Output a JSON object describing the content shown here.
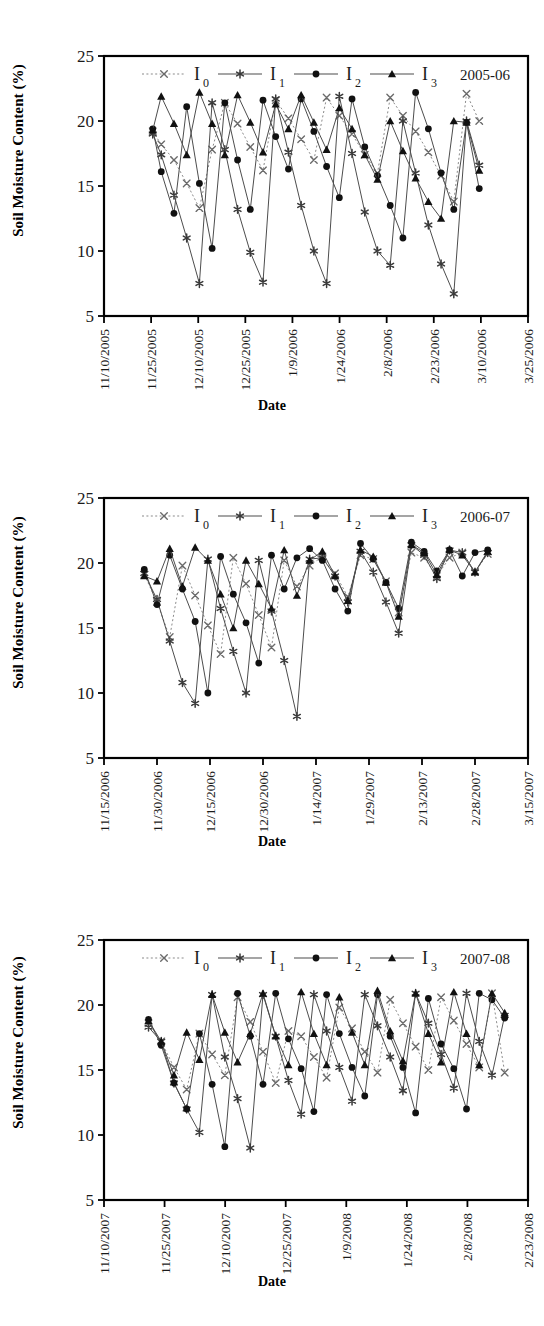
{
  "figure": {
    "axis_titles": {
      "y": "Soil Moisture Content (%)",
      "x": "Date"
    },
    "y_ticks": [
      "5",
      "10",
      "15",
      "20",
      "25"
    ],
    "y_range": [
      5,
      25
    ],
    "legend_labels": [
      "I",
      "I",
      "I",
      "I"
    ],
    "legend_subs": [
      "0",
      "1",
      "2",
      "3"
    ],
    "series_names": [
      "I0",
      "I1",
      "I2",
      "I3"
    ],
    "markers": [
      "x-cross",
      "asterisk",
      "filled-circle",
      "filled-triangle"
    ],
    "colors": {
      "line": "#4d4d4d",
      "marker": "#111111",
      "axis": "#000000",
      "background": "#ffffff"
    }
  },
  "chart_data": [
    {
      "type": "line",
      "title": "2005-06",
      "xlabel": "Date",
      "ylabel": "Soil Moisture Content (%)",
      "ylim": [
        5,
        25
      ],
      "grid": false,
      "legend_position": "top-center",
      "x_ticks": [
        "11/10/2005",
        "11/25/2005",
        "12/10/2005",
        "12/25/2005",
        "1/9/2006",
        "1/24/2006",
        "2/8/2006",
        "2/23/2006",
        "3/10/2006",
        "3/25/2006"
      ],
      "x_range": [
        "11/10/2005",
        "3/25/2006"
      ],
      "x": [
        0.115,
        0.135,
        0.165,
        0.195,
        0.225,
        0.255,
        0.285,
        0.315,
        0.345,
        0.375,
        0.405,
        0.435,
        0.465,
        0.495,
        0.525,
        0.555,
        0.585,
        0.615,
        0.645,
        0.675,
        0.705,
        0.735,
        0.765,
        0.795,
        0.825,
        0.855,
        0.885
      ],
      "series": [
        {
          "name": "I0",
          "marker": "x-cross",
          "linestyle": "dotted",
          "values": [
            19.2,
            18.2,
            17.0,
            15.2,
            13.3,
            17.8,
            21.4,
            19.8,
            18.0,
            16.2,
            21.6,
            20.2,
            18.6,
            17.0,
            21.8,
            20.4,
            19.0,
            17.4,
            16.0,
            21.8,
            20.4,
            19.2,
            17.6,
            15.8,
            13.8,
            22.1,
            20.0
          ]
        },
        {
          "name": "I1",
          "marker": "asterisk",
          "linestyle": "solid",
          "values": [
            19.0,
            17.4,
            14.3,
            11.0,
            7.5,
            21.4,
            17.8,
            13.2,
            9.9,
            7.6,
            21.7,
            17.6,
            13.5,
            10.0,
            7.5,
            21.9,
            17.5,
            13.0,
            10.0,
            8.9,
            20.0,
            16.0,
            12.0,
            9.0,
            6.7,
            20.0,
            16.6
          ]
        },
        {
          "name": "I2",
          "marker": "filled-circle",
          "linestyle": "solid",
          "values": [
            19.4,
            16.1,
            12.9,
            21.1,
            15.2,
            10.2,
            21.4,
            17.0,
            13.2,
            21.6,
            18.8,
            16.3,
            21.7,
            19.2,
            16.5,
            14.1,
            21.7,
            18.0,
            15.8,
            13.5,
            11.0,
            22.2,
            19.4,
            16.0,
            13.2,
            19.9,
            14.8
          ]
        },
        {
          "name": "I3",
          "marker": "filled-triangle",
          "linestyle": "solid",
          "values": [
            19.3,
            21.9,
            19.8,
            17.4,
            22.2,
            19.8,
            17.4,
            22.0,
            19.9,
            17.6,
            21.3,
            19.4,
            22.0,
            19.9,
            17.8,
            21.0,
            19.4,
            17.4,
            15.5,
            20.0,
            17.7,
            15.6,
            13.8,
            12.5,
            20.0,
            19.9,
            16.2
          ]
        }
      ]
    },
    {
      "type": "line",
      "title": "2006-07",
      "xlabel": "Date",
      "ylabel": "Soil Moisture Content (%)",
      "ylim": [
        5,
        25
      ],
      "grid": false,
      "legend_position": "top-center",
      "x_ticks": [
        "11/15/2006",
        "11/30/2006",
        "12/15/2006",
        "12/30/2006",
        "1/14/2007",
        "1/29/2007",
        "2/13/2007",
        "2/28/2007",
        "3/15/2007"
      ],
      "x_range": [
        "11/15/2006",
        "3/15/2007"
      ],
      "x": [
        0.095,
        0.125,
        0.155,
        0.185,
        0.215,
        0.245,
        0.275,
        0.305,
        0.335,
        0.365,
        0.395,
        0.425,
        0.455,
        0.485,
        0.515,
        0.545,
        0.575,
        0.605,
        0.635,
        0.665,
        0.695,
        0.725,
        0.755,
        0.785,
        0.815,
        0.845,
        0.875,
        0.905
      ],
      "series": [
        {
          "name": "I0",
          "marker": "x-cross",
          "linestyle": "dotted",
          "values": [
            19.1,
            17.0,
            14.3,
            19.8,
            17.5,
            15.2,
            13.0,
            20.4,
            18.4,
            16.0,
            13.5,
            20.2,
            18.2,
            19.8,
            20.5,
            19.2,
            17.4,
            20.6,
            20.3,
            18.6,
            16.2,
            20.8,
            20.4,
            19.0,
            20.4,
            20.8,
            19.3,
            20.7
          ]
        },
        {
          "name": "I1",
          "marker": "asterisk",
          "linestyle": "solid",
          "values": [
            19.2,
            17.2,
            14.0,
            10.8,
            9.2,
            20.3,
            16.5,
            13.2,
            10.0,
            20.2,
            16.3,
            12.5,
            8.2,
            20.3,
            20.4,
            19.0,
            17.0,
            20.9,
            19.3,
            17.0,
            14.6,
            21.4,
            20.6,
            18.8,
            21.0,
            20.8,
            19.3,
            20.8
          ]
        },
        {
          "name": "I2",
          "marker": "filled-circle",
          "linestyle": "solid",
          "values": [
            19.5,
            16.8,
            20.6,
            18.0,
            15.5,
            10.0,
            20.5,
            17.6,
            15.4,
            12.3,
            20.6,
            18.0,
            20.4,
            21.1,
            20.2,
            18.0,
            16.3,
            21.5,
            20.3,
            18.5,
            16.5,
            21.6,
            20.9,
            19.4,
            21.0,
            19.0,
            20.8,
            21.0
          ]
        },
        {
          "name": "I3",
          "marker": "filled-triangle",
          "linestyle": "solid",
          "values": [
            19.0,
            18.6,
            21.1,
            18.2,
            21.2,
            20.2,
            17.6,
            15.0,
            20.2,
            18.4,
            16.5,
            21.0,
            17.5,
            20.2,
            20.9,
            19.0,
            17.1,
            21.0,
            20.5,
            18.5,
            15.9,
            21.4,
            20.8,
            19.1,
            21.0,
            20.6,
            19.3,
            20.9
          ]
        }
      ]
    },
    {
      "type": "line",
      "title": "2007-08",
      "xlabel": "Date",
      "ylabel": "Soil Moisture Content (%)",
      "ylim": [
        5,
        25
      ],
      "grid": false,
      "legend_position": "top-center",
      "x_ticks": [
        "11/10/2007",
        "11/25/2007",
        "12/10/2007",
        "12/25/2007",
        "1/9/2008",
        "1/24/2008",
        "2/8/2008",
        "2/23/2008"
      ],
      "x_range": [
        "11/10/2007",
        "2/23/2008"
      ],
      "x": [
        0.105,
        0.135,
        0.165,
        0.195,
        0.225,
        0.255,
        0.285,
        0.315,
        0.345,
        0.375,
        0.405,
        0.435,
        0.465,
        0.495,
        0.525,
        0.555,
        0.585,
        0.615,
        0.645,
        0.675,
        0.705,
        0.735,
        0.765,
        0.795,
        0.825,
        0.855,
        0.885,
        0.915,
        0.945
      ],
      "values_note": "irrigation sawtooth cycles",
      "series": [
        {
          "name": "I0",
          "marker": "x-cross",
          "linestyle": "dotted",
          "values": [
            18.6,
            17.2,
            15.2,
            13.5,
            17.8,
            16.2,
            14.6,
            20.6,
            18.7,
            16.4,
            14.0,
            18.0,
            17.6,
            16.0,
            14.4,
            19.8,
            18.2,
            16.4,
            14.8,
            20.4,
            18.6,
            16.8,
            15.0,
            20.6,
            18.8,
            17.0,
            15.2,
            20.9,
            14.8
          ]
        },
        {
          "name": "I1",
          "marker": "asterisk",
          "linestyle": "solid",
          "values": [
            18.3,
            17.2,
            14.0,
            12.0,
            10.2,
            20.8,
            16.0,
            12.8,
            9.0,
            20.8,
            17.6,
            14.2,
            11.6,
            20.8,
            18.0,
            15.2,
            12.6,
            20.8,
            18.4,
            16.0,
            13.4,
            20.9,
            18.6,
            16.2,
            13.6,
            20.9,
            17.2,
            14.6,
            19.2
          ]
        },
        {
          "name": "I2",
          "marker": "filled-circle",
          "linestyle": "solid",
          "values": [
            18.9,
            16.9,
            14.0,
            12.0,
            17.8,
            13.9,
            9.1,
            20.9,
            17.6,
            13.9,
            20.9,
            17.4,
            15.1,
            11.8,
            20.8,
            17.8,
            15.2,
            13.0,
            20.8,
            17.6,
            15.2,
            11.7,
            20.5,
            17.0,
            15.1,
            12.0,
            20.9,
            20.4,
            19.0
          ]
        },
        {
          "name": "I3",
          "marker": "filled-triangle",
          "linestyle": "solid",
          "values": [
            18.8,
            17.2,
            14.6,
            17.9,
            15.8,
            20.8,
            17.9,
            15.6,
            17.8,
            20.9,
            17.6,
            15.4,
            21.0,
            17.8,
            15.4,
            20.6,
            17.9,
            15.4,
            21.1,
            18.0,
            15.7,
            20.9,
            17.8,
            15.6,
            21.0,
            17.8,
            15.4,
            20.9,
            19.4
          ]
        }
      ]
    }
  ]
}
